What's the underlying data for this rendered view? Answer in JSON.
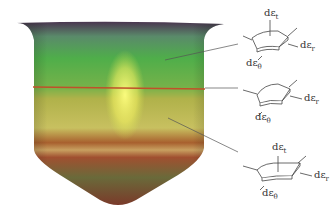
{
  "diagram": {
    "elements": [
      {
        "position": "upper wall",
        "labels": {
          "top": "dε",
          "top_sub": "t",
          "right": "dε",
          "right_sub": "r",
          "bottom": "dε",
          "bottom_sub": "θ"
        }
      },
      {
        "position": "middle wall",
        "labels": {
          "right": "dε",
          "right_sub": "r",
          "bottom": "dε",
          "bottom_sub": "θ"
        }
      },
      {
        "position": "lower wall",
        "labels": {
          "top": "dε",
          "top_sub": "t",
          "right": "dε",
          "right_sub": "r",
          "bottom": "dε",
          "bottom_sub": "θ"
        }
      }
    ],
    "colors": {
      "green": "#4fae4a",
      "yellow": "#e8ec6a",
      "red_band": "#a0402a",
      "rim": "#4a2c4a",
      "line": "#555555"
    }
  }
}
